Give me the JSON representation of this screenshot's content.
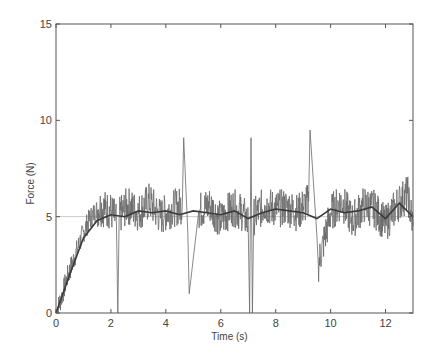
{
  "chart_data": {
    "type": "line",
    "title": "",
    "xlabel": "Time (s)",
    "ylabel": "Force (N)",
    "xlim": [
      0,
      13
    ],
    "ylim": [
      0,
      15
    ],
    "xticks": [
      0,
      2,
      4,
      6,
      8,
      10,
      12
    ],
    "yticks": [
      0,
      5,
      10,
      15
    ],
    "grid": false,
    "legend": null,
    "reference_line": {
      "y": 5,
      "note": "faint horizontal line at target force 5 N"
    },
    "series": [
      {
        "name": "raw force",
        "style": "noisy gray line",
        "description": "Ramps from 0 to ~5 N over 0-1.5 s, then fluctuates around 5 N (roughly 3.5-7 N) until 13 s",
        "x": [
          0,
          0.2,
          0.4,
          0.6,
          0.8,
          1.0,
          1.2,
          1.4,
          1.6,
          1.8,
          2.0,
          2.2,
          2.25,
          2.3,
          2.6,
          3.0,
          3.4,
          3.8,
          4.2,
          4.6,
          4.65,
          4.8,
          4.85,
          5.2,
          5.6,
          6.0,
          6.4,
          6.8,
          7.0,
          7.05,
          7.1,
          7.15,
          7.2,
          7.6,
          8.0,
          8.4,
          8.8,
          9.2,
          9.25,
          9.5,
          9.55,
          10.0,
          10.4,
          10.8,
          11.2,
          11.6,
          12.0,
          12.4,
          12.8,
          13.0
        ],
        "values": [
          0,
          0.8,
          1.8,
          2.6,
          3.4,
          4.2,
          4.8,
          5.2,
          5.5,
          5.4,
          5.3,
          4.8,
          0,
          5.0,
          5.6,
          5.2,
          5.8,
          5.0,
          5.4,
          5.6,
          9.1,
          4.2,
          1.0,
          5.3,
          5.6,
          4.8,
          5.5,
          5.2,
          4.6,
          0,
          9.1,
          0,
          5.0,
          5.6,
          5.4,
          5.5,
          5.2,
          5.8,
          9.5,
          4.0,
          2.5,
          5.2,
          5.8,
          4.8,
          5.6,
          5.4,
          4.6,
          5.6,
          6.2,
          4.5
        ]
      },
      {
        "name": "filtered force",
        "style": "smooth dark line",
        "x": [
          0,
          0.5,
          1.0,
          1.5,
          2.0,
          2.5,
          3.0,
          3.5,
          4.0,
          4.5,
          5.0,
          5.5,
          6.0,
          6.5,
          7.0,
          7.5,
          8.0,
          8.5,
          9.0,
          9.5,
          10.0,
          10.5,
          11.0,
          11.5,
          12.0,
          12.5,
          13.0
        ],
        "values": [
          0,
          2.0,
          3.9,
          4.8,
          5.1,
          5.0,
          5.3,
          5.2,
          5.3,
          5.1,
          5.3,
          5.2,
          5.1,
          5.3,
          4.9,
          5.2,
          5.4,
          5.3,
          5.2,
          4.9,
          5.4,
          5.2,
          5.3,
          5.5,
          4.9,
          5.7,
          5.0
        ]
      }
    ]
  },
  "axes": {
    "xlabel": "Time (s)",
    "ylabel": "Force (N)",
    "xtick_labels": [
      "0",
      "2",
      "4",
      "6",
      "8",
      "10",
      "12"
    ],
    "ytick_labels": [
      "0",
      "5",
      "10",
      "15"
    ]
  }
}
